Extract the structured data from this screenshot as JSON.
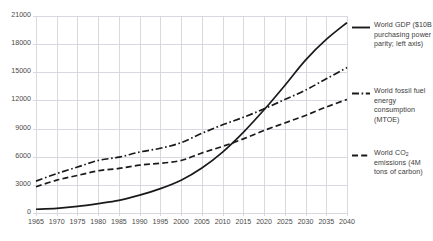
{
  "chart_data": {
    "type": "line",
    "title": "",
    "xlabel": "",
    "ylabel": "",
    "xlim": [
      1965,
      2040
    ],
    "ylim": [
      0,
      21000
    ],
    "grid": true,
    "legend_position": "right",
    "xticks": [
      "1965",
      "1970",
      "1975",
      "1980",
      "1985",
      "1990",
      "1995",
      "2000",
      "2005",
      "2010",
      "2015",
      "2020",
      "2025",
      "2030",
      "2035",
      "2040"
    ],
    "yticks": [
      "0",
      "3000",
      "6000",
      "9000",
      "12000",
      "15000",
      "18000",
      "21000"
    ],
    "x": [
      1965,
      1970,
      1975,
      1980,
      1985,
      1990,
      1995,
      2000,
      2005,
      2010,
      2015,
      2020,
      2025,
      2030,
      2035,
      2040
    ],
    "series": [
      {
        "name": "World GDP ($10B purchasing power parity; left axis)",
        "short_name": "World GDP",
        "style": "solid",
        "color": "#1a1a1a",
        "values": [
          400,
          500,
          700,
          1000,
          1350,
          1900,
          2600,
          3500,
          4800,
          6500,
          8600,
          11000,
          13600,
          16300,
          18500,
          20300
        ]
      },
      {
        "name": "World fossil fuel energy consumption (MTOE)",
        "short_name": "World fossil fuel energy consumption",
        "style": "dash-dot",
        "color": "#1a1a1a",
        "values": [
          3400,
          4200,
          4900,
          5600,
          5950,
          6500,
          6900,
          7500,
          8500,
          9400,
          10200,
          11100,
          12100,
          13100,
          14300,
          15500
        ]
      },
      {
        "name": "World CO2 emissions (4M tons of carbon)",
        "short_name": "World CO2 emissions",
        "style": "dashed",
        "color": "#1a1a1a",
        "values": [
          2800,
          3500,
          4000,
          4500,
          4750,
          5100,
          5300,
          5600,
          6400,
          7100,
          7900,
          8800,
          9600,
          10400,
          11300,
          12100
        ]
      }
    ]
  },
  "legend": {
    "entries": [
      {
        "key": "gdp",
        "label": "World GDP ($10B purchasing power parity; left axis)",
        "swatch": "solid-line-swatch"
      },
      {
        "key": "fossil",
        "label": "World fossil fuel energy consumption (MTOE)",
        "swatch": "dash-dot-line-swatch"
      },
      {
        "key": "co2",
        "label": "World CO₂ emissions (4M tons of carbon)",
        "swatch": "dashed-line-swatch"
      }
    ]
  },
  "colors": {
    "line": "#1a1a1a",
    "grid": "#d8d8e0",
    "axis_text": "#4a4a4a",
    "legend_text": "#3b3b3b",
    "background": "#ffffff"
  }
}
